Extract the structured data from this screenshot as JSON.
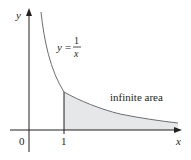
{
  "figure": {
    "function_label": {
      "lhs": "y",
      "eq": "=",
      "numerator": "1",
      "denominator": "x"
    },
    "region_label": "infinite area",
    "axes": {
      "x_label": "x",
      "y_label": "y",
      "origin_label": "0",
      "x_tick_labels": [
        "1"
      ]
    },
    "colors": {
      "axis": "#231f20",
      "curve": "#6d6e71",
      "shade": "#e6e7e8",
      "text": "#231f20"
    },
    "region": {
      "x_from": 1,
      "x_to": "infinity",
      "description": "area under y=1/x for x ≥ 1"
    }
  }
}
